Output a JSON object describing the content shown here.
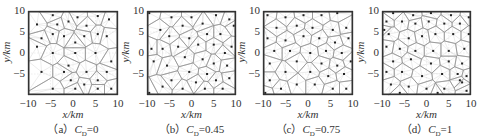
{
  "figure": {
    "panels": [
      {
        "id": "a",
        "caption_prefix": "（a）",
        "caption_var": "C",
        "caption_sub": "D",
        "caption_value": "=0"
      },
      {
        "id": "b",
        "caption_prefix": "（b）",
        "caption_var": "C",
        "caption_sub": "D",
        "caption_value": "=0.45"
      },
      {
        "id": "c",
        "caption_prefix": "（c）",
        "caption_var": "C",
        "caption_sub": "D",
        "caption_value": "=0.75"
      },
      {
        "id": "d",
        "caption_prefix": "（d）",
        "caption_var": "C",
        "caption_sub": "D",
        "caption_value": "=1"
      }
    ],
    "xlabel": "x/km",
    "ylabel": "y/km",
    "xticks": [
      "−10",
      "−5",
      "0",
      "5",
      "10"
    ],
    "yticks": [
      "10",
      "5",
      "0",
      "−5"
    ],
    "colors": {
      "frame": "#333333",
      "cell_edge": "#8a8a8a",
      "site": "#222222",
      "spoke": "#c8c8c8"
    }
  },
  "chart_data": [
    {
      "type": "scatter",
      "title": "(a) C_D=0",
      "xlabel": "x/km",
      "ylabel": "y/km",
      "xlim": [
        -10,
        10
      ],
      "ylim": [
        -10,
        10
      ],
      "xticks": [
        -10,
        -5,
        0,
        5,
        10
      ],
      "yticks": [
        -5,
        0,
        5,
        10
      ],
      "annotation": "Voronoi tessellation of station sites",
      "points": [
        [
          -4.5,
          9.0
        ],
        [
          1.0,
          8.5
        ],
        [
          5.5,
          8.8
        ],
        [
          8.0,
          8.0
        ],
        [
          -8.0,
          6.8
        ],
        [
          -3.5,
          6.8
        ],
        [
          -1.0,
          7.5
        ],
        [
          3.0,
          6.5
        ],
        [
          -7.0,
          3.5
        ],
        [
          -4.5,
          4.5
        ],
        [
          -2.0,
          4.0
        ],
        [
          0.5,
          2.5
        ],
        [
          2.5,
          4.0
        ],
        [
          5.5,
          4.5
        ],
        [
          7.5,
          4.0
        ],
        [
          -8.0,
          1.5
        ],
        [
          -4.5,
          0.0
        ],
        [
          0.5,
          0.0
        ],
        [
          5.0,
          0.0
        ],
        [
          8.5,
          -2.0
        ],
        [
          -1.0,
          -3.0
        ],
        [
          -7.0,
          -4.5
        ],
        [
          -2.0,
          -4.5
        ],
        [
          3.0,
          -4.5
        ],
        [
          7.5,
          -4.5
        ],
        [
          -0.5,
          -6.5
        ],
        [
          5.5,
          -6.5
        ],
        [
          -4.5,
          -8.5
        ],
        [
          0.5,
          -8.5
        ],
        [
          2.5,
          -7.5
        ],
        [
          5.5,
          -8.5
        ],
        [
          8.5,
          -8.5
        ]
      ]
    },
    {
      "type": "scatter",
      "title": "(b) C_D=0.45",
      "xlabel": "x/km",
      "ylabel": "y/km",
      "xlim": [
        -10,
        10
      ],
      "ylim": [
        -10,
        10
      ],
      "xticks": [
        -10,
        -5,
        0,
        5,
        10
      ],
      "yticks": [
        -5,
        0,
        5,
        10
      ],
      "points": [
        [
          -9.5,
          9.5
        ],
        [
          -4.5,
          8.5
        ],
        [
          0.0,
          8.5
        ],
        [
          5.5,
          9.0
        ],
        [
          8.5,
          8.0
        ],
        [
          -7.0,
          5.5
        ],
        [
          -2.0,
          6.5
        ],
        [
          2.5,
          7.0
        ],
        [
          9.5,
          6.5
        ],
        [
          -5.0,
          4.0
        ],
        [
          -0.5,
          3.5
        ],
        [
          3.5,
          4.5
        ],
        [
          6.5,
          4.5
        ],
        [
          -9.0,
          1.0
        ],
        [
          -6.5,
          1.0
        ],
        [
          -3.0,
          1.5
        ],
        [
          1.5,
          2.0
        ],
        [
          5.0,
          2.0
        ],
        [
          7.5,
          0.0
        ],
        [
          9.0,
          1.5
        ],
        [
          -8.5,
          -2.0
        ],
        [
          -1.5,
          -1.0
        ],
        [
          2.5,
          -1.5
        ],
        [
          5.0,
          -2.5
        ],
        [
          8.0,
          -3.0
        ],
        [
          -5.5,
          -3.0
        ],
        [
          -0.5,
          -4.5
        ],
        [
          3.5,
          -5.0
        ],
        [
          -4.5,
          -6.5
        ],
        [
          1.0,
          -7.0
        ],
        [
          5.5,
          -6.5
        ],
        [
          8.5,
          -6.0
        ],
        [
          -9.5,
          -9.5
        ],
        [
          -2.0,
          -8.5
        ],
        [
          3.0,
          -8.5
        ],
        [
          7.0,
          -8.5
        ],
        [
          -6.5,
          -8.0
        ]
      ]
    },
    {
      "type": "scatter",
      "title": "(c) C_D=0.75",
      "xlabel": "x/km",
      "ylabel": "y/km",
      "xlim": [
        -10,
        10
      ],
      "ylim": [
        -10,
        10
      ],
      "xticks": [
        -10,
        -5,
        0,
        5,
        10
      ],
      "yticks": [
        -5,
        0,
        5,
        10
      ],
      "points": [
        [
          -9.0,
          9.0
        ],
        [
          -5.0,
          8.5
        ],
        [
          -1.0,
          9.0
        ],
        [
          3.0,
          9.0
        ],
        [
          6.5,
          9.5
        ],
        [
          -7.0,
          6.0
        ],
        [
          -2.5,
          6.5
        ],
        [
          1.0,
          6.0
        ],
        [
          5.5,
          5.5
        ],
        [
          8.5,
          6.0
        ],
        [
          -9.0,
          3.5
        ],
        [
          -5.0,
          3.0
        ],
        [
          -1.0,
          4.0
        ],
        [
          2.5,
          3.5
        ],
        [
          6.0,
          2.5
        ],
        [
          9.0,
          3.5
        ],
        [
          -7.5,
          0.5
        ],
        [
          -4.0,
          0.5
        ],
        [
          0.5,
          0.0
        ],
        [
          4.0,
          0.5
        ],
        [
          7.5,
          0.0
        ],
        [
          -8.5,
          -2.5
        ],
        [
          -2.5,
          -2.0
        ],
        [
          3.0,
          -2.5
        ],
        [
          6.5,
          -3.0
        ],
        [
          9.5,
          -2.0
        ],
        [
          -5.0,
          -4.5
        ],
        [
          0.5,
          -4.5
        ],
        [
          4.5,
          -5.5
        ],
        [
          8.0,
          -5.0
        ],
        [
          -8.5,
          -6.5
        ],
        [
          -2.5,
          -7.5
        ],
        [
          1.5,
          -7.5
        ],
        [
          5.5,
          -8.5
        ],
        [
          8.5,
          -8.5
        ],
        [
          -6.0,
          -8.5
        ],
        [
          -9.5,
          -9.5
        ]
      ]
    },
    {
      "type": "scatter",
      "title": "(d) C_D=1",
      "xlabel": "x/km",
      "ylabel": "y/km",
      "xlim": [
        -10,
        10
      ],
      "ylim": [
        -10,
        10
      ],
      "xticks": [
        -10,
        -5,
        0,
        5,
        10
      ],
      "yticks": [
        -5,
        0,
        5,
        10
      ],
      "points": [
        [
          -7.5,
          9.5
        ],
        [
          -3.0,
          9.0
        ],
        [
          1.0,
          9.5
        ],
        [
          5.5,
          9.0
        ],
        [
          9.5,
          8.5
        ],
        [
          -9.0,
          7.5
        ],
        [
          -5.5,
          7.5
        ],
        [
          -2.5,
          7.0
        ],
        [
          0.5,
          7.5
        ],
        [
          4.0,
          7.0
        ],
        [
          7.5,
          7.0
        ],
        [
          -9.5,
          5.5
        ],
        [
          -8.5,
          4.5
        ],
        [
          -4.0,
          3.5
        ],
        [
          -1.0,
          4.0
        ],
        [
          2.0,
          4.5
        ],
        [
          6.0,
          4.5
        ],
        [
          9.5,
          4.5
        ],
        [
          -9.0,
          1.5
        ],
        [
          -6.0,
          1.0
        ],
        [
          -2.5,
          0.5
        ],
        [
          1.5,
          0.5
        ],
        [
          5.0,
          0.5
        ],
        [
          8.5,
          1.0
        ],
        [
          -7.5,
          -2.0
        ],
        [
          -3.5,
          -1.5
        ],
        [
          1.0,
          -2.5
        ],
        [
          5.0,
          -2.0
        ],
        [
          8.0,
          -2.5
        ],
        [
          -9.0,
          -4.5
        ],
        [
          -5.5,
          -4.5
        ],
        [
          -1.0,
          -5.5
        ],
        [
          3.5,
          -5.0
        ],
        [
          7.0,
          -5.0
        ],
        [
          9.0,
          -5.5
        ],
        [
          7.5,
          -6.5
        ],
        [
          8.0,
          -7.0
        ],
        [
          -8.0,
          -7.5
        ],
        [
          -4.0,
          -8.0
        ],
        [
          0.0,
          -8.5
        ],
        [
          4.0,
          -8.5
        ],
        [
          9.0,
          -9.0
        ],
        [
          -6.0,
          -9.5
        ],
        [
          2.5,
          -9.5
        ]
      ]
    }
  ]
}
